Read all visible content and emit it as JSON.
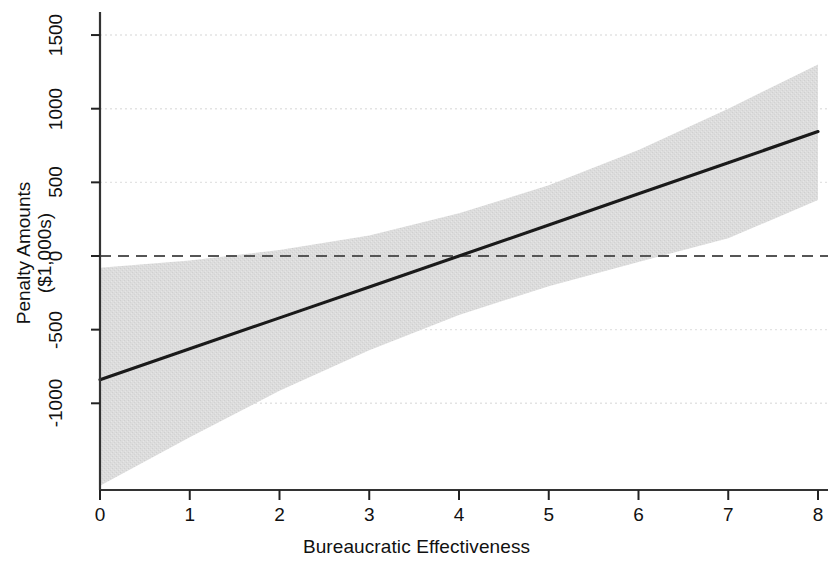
{
  "chart_data": {
    "type": "line",
    "title": "",
    "subtitle": "",
    "xlabel": "Bureaucratic Effectiveness",
    "ylabel_line1": "Penalty Amounts",
    "ylabel_line2": "($1,000s)",
    "xlim": [
      0,
      8
    ],
    "ylim": [
      -1560,
      1600
    ],
    "xticks": [
      0,
      1,
      2,
      3,
      4,
      5,
      6,
      7,
      8
    ],
    "xtick_labels": [
      "0",
      "1",
      "2",
      "3",
      "4",
      "5",
      "6",
      "7",
      "8"
    ],
    "yticks": [
      -1000,
      -500,
      0,
      500,
      1000,
      1500
    ],
    "ytick_labels": [
      "-1000",
      "-500",
      "0",
      "500",
      "1000",
      "1500"
    ],
    "grid": true,
    "grid_axis": "y",
    "legend": null,
    "reference_line": {
      "name": "zero-line",
      "y": 0,
      "style": "dashed",
      "color": "#555555"
    },
    "series": [
      {
        "name": "Marginal effect",
        "type": "line",
        "style": "solid",
        "color": "#1a1a1a",
        "x": [
          0,
          1,
          2,
          3,
          4,
          5,
          6,
          7,
          8
        ],
        "values": [
          -840,
          -630,
          -420,
          -210,
          0,
          211,
          422,
          633,
          845
        ]
      },
      {
        "name": "95% confidence interval",
        "type": "band",
        "color": "#d9d9d9",
        "x": [
          0,
          1,
          2,
          3,
          4,
          5,
          6,
          7,
          8
        ],
        "lower": [
          -1560,
          -1230,
          -915,
          -640,
          -400,
          -205,
          -40,
          120,
          380
        ],
        "upper": [
          -80,
          -30,
          40,
          140,
          290,
          480,
          720,
          1000,
          1300
        ]
      }
    ]
  },
  "axes": {
    "x_title": "Bureaucratic Effectiveness",
    "y_title_line1": "Penalty Amounts",
    "y_title_line2": "($1,000s)"
  },
  "colors": {
    "line": "#1a1a1a",
    "band": "#d9d9d9",
    "grid": "#e3e3e3",
    "zero_line": "#555555",
    "axis": "#222222",
    "text": "#111111",
    "background": "#ffffff"
  }
}
